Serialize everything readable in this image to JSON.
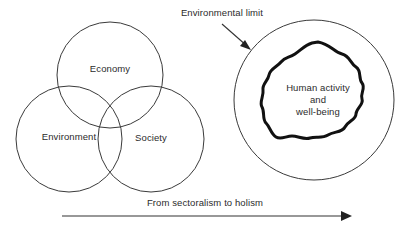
{
  "figure": {
    "background_color": "#ffffff",
    "stroke_color": "#3a3a3a",
    "blob_stroke_color": "#111111",
    "text_color": "#2b2b2b"
  },
  "venn": {
    "economy_label": "Economy",
    "environment_label": "Environment",
    "society_label": "Society"
  },
  "nested": {
    "annotation_label": "Environmental limit",
    "core_line_1": "Human activity",
    "core_line_2": "and",
    "core_line_3": "well-being"
  },
  "axis": {
    "caption": "From sectoralism to holism"
  },
  "icons": {
    "annotation_arrow": "arrow-down-right-icon",
    "progression_arrow": "arrow-right-icon"
  }
}
